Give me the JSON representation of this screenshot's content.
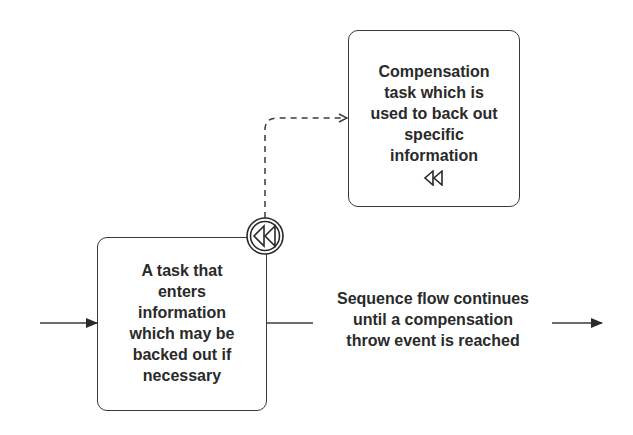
{
  "diagram": {
    "type": "BPMN compensation example",
    "colors": {
      "stroke": "#3a3a3a",
      "text": "#2a2a2a",
      "background": "#ffffff"
    },
    "main_task": {
      "label": "A task that\nenters\ninformation\nwhich may be\nbacked out if\nnecessary"
    },
    "compensation_task": {
      "label": "Compensation\ntask which is\nused to back out\nspecific\ninformation",
      "marker_icon": "compensation-rewind-icon"
    },
    "boundary_event": {
      "type": "compensation intermediate event",
      "icon": "compensation-rewind-icon"
    },
    "association": {
      "style": "dashed",
      "from": "boundary_event",
      "to": "compensation_task"
    },
    "sequence_flow": {
      "label": "Sequence flow continues\nuntil a compensation\nthrow event is reached"
    },
    "incoming_flow": {
      "style": "solid arrow"
    },
    "outgoing_flow": {
      "style": "solid arrow"
    }
  }
}
